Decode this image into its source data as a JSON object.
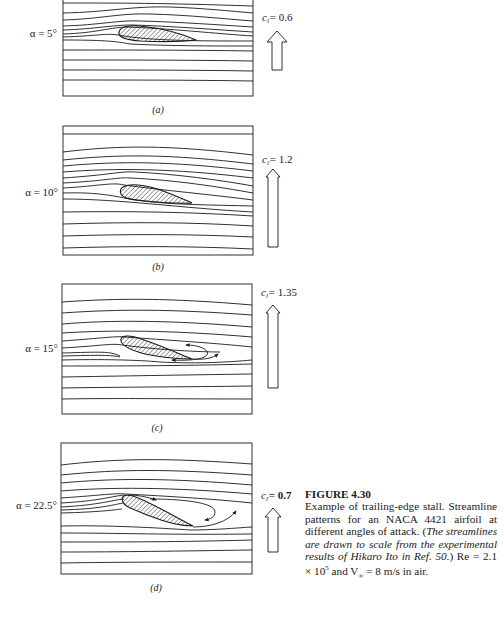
{
  "figure": {
    "number": "FIGURE 4.30",
    "caption_plain_1": "Example of trailing-edge stall. Streamline patterns for an NACA 4421 airfoil at different angles of attack. (",
    "caption_italic": "The streamlines are drawn to scale from the experimental results of Hikaro Ito in Ref. 50.",
    "caption_plain_2": ") Re = 2.1 × 10",
    "caption_exp": "5",
    "caption_plain_3": " and V",
    "caption_sub": "∞",
    "caption_plain_4": " = 8 m/s in air."
  },
  "panels": [
    {
      "id": "a",
      "label": "(a)",
      "alpha": "α = 5°",
      "cl_symbol": "c",
      "cl_sub": "l",
      "cl_value": "= 0.6",
      "cl_bold": false
    },
    {
      "id": "b",
      "label": "(b)",
      "alpha": "α = 10°",
      "cl_symbol": "c",
      "cl_sub": "l",
      "cl_value": "= 1.2",
      "cl_bold": false
    },
    {
      "id": "c",
      "label": "(c)",
      "alpha": "α = 15°",
      "cl_symbol": "c",
      "cl_sub": "l",
      "cl_value": "= 1.35",
      "cl_bold": false
    },
    {
      "id": "d",
      "label": "(d)",
      "alpha": "α = 22.5°",
      "cl_symbol": "c",
      "cl_sub": "l",
      "cl_value": "= 0.7",
      "cl_bold": true
    }
  ],
  "colors": {
    "ink": "#1a1a1a",
    "paper": "#ffffff"
  }
}
